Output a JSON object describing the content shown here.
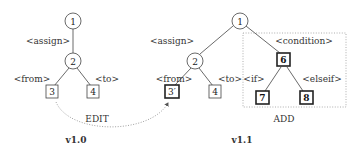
{
  "diagram": {
    "left_tree": {
      "version_label": "v1.0",
      "operation_label": "EDIT",
      "nodes": [
        {
          "id": "1",
          "shape": "circle"
        },
        {
          "id": "2",
          "shape": "circle",
          "edge_label": "<assign>"
        },
        {
          "id": "3",
          "shape": "square",
          "edge_label": "<from>"
        },
        {
          "id": "4",
          "shape": "square",
          "edge_label": "<to>"
        }
      ]
    },
    "right_tree": {
      "version_label": "v1.1",
      "operation_label": "ADD",
      "nodes": [
        {
          "id": "1",
          "shape": "circle"
        },
        {
          "id": "2",
          "shape": "circle",
          "edge_label": "<assign>"
        },
        {
          "id": "3′",
          "shape": "square-bold",
          "edge_label": "<from>"
        },
        {
          "id": "4",
          "shape": "square",
          "edge_label": "<to>"
        },
        {
          "id": "6",
          "shape": "square-bold",
          "edge_label": "<condition>"
        },
        {
          "id": "7",
          "shape": "square-bold",
          "edge_label": "<if>"
        },
        {
          "id": "8",
          "shape": "square-bold",
          "edge_label": "<elseif>"
        }
      ]
    },
    "labels": {
      "l_n1": "1",
      "l_n2": "2",
      "l_n3": "3",
      "l_n4": "4",
      "l_assign": "<assign>",
      "l_from": "<from>",
      "l_to": "<to>",
      "edit": "EDIT",
      "v10": "v1.0",
      "r_n1": "1",
      "r_n2": "2",
      "r_n3": "3′",
      "r_n4": "4",
      "r_n6": "6",
      "r_n7": "7",
      "r_n8": "8",
      "r_assign": "<assign>",
      "r_from": "<from>",
      "r_to": "<to>",
      "r_condition": "<condition>",
      "r_if": "<if>",
      "r_elseif": "<elseif>",
      "add": "ADD",
      "v11": "v1.1"
    }
  }
}
